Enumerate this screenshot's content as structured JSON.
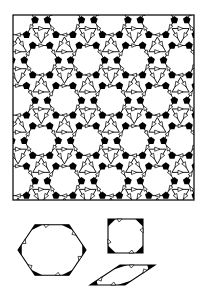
{
  "figure": {
    "kind": "dodecagonal-tiling-with-decorated-prototiles",
    "colors": {
      "background": "#ffffff",
      "ink": "#000000"
    },
    "tiling": {
      "description": "Square-hexagon-rhombus tiling with black decorated vertex clusters and open triangular arrow markings along edges",
      "tile_types": [
        "hexagon",
        "square",
        "rhombus"
      ]
    },
    "prototiles": [
      {
        "name": "hexagon",
        "sides": 6,
        "decoration": "black corner wedges with open triangle arrows"
      },
      {
        "name": "square",
        "sides": 4,
        "decoration": "black corner wedges with open triangle arrows"
      },
      {
        "name": "rhombus",
        "sides": 4,
        "angle_deg": 30,
        "decoration": "black wedges with open triangle arrows"
      }
    ]
  }
}
